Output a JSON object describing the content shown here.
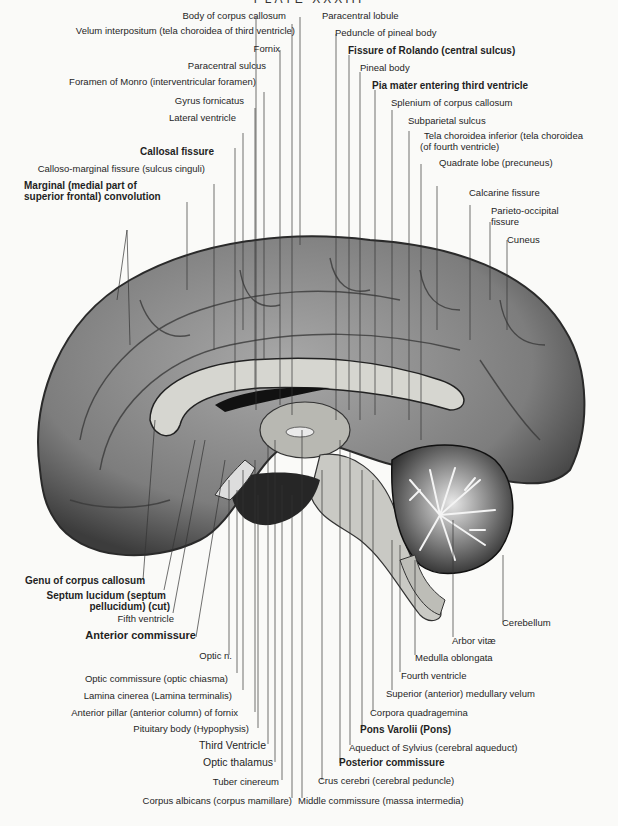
{
  "plate": {
    "title": "PLATE XXXIII"
  },
  "figure": {
    "colors": {
      "ink": "#1f1f1f",
      "cortex": "#8a8a8a",
      "cortex_dark": "#4a4a4a",
      "section": "#c9c9c4",
      "paper": "#fafaf8"
    }
  },
  "labels": {
    "top_left": [
      "Body of corpus callosum",
      "Velum interpositum (tela choroidea of third ventricle)",
      "Fornix",
      "Paracentral sulcus",
      "Foramen of Monro (interventricular foramen)",
      "Gyrus fornicatus",
      "Lateral ventricle",
      "Callosal fissure",
      "Calloso-marginal fissure (sulcus cinguli)",
      "Marginal (medial part of",
      "superior frontal) convolution"
    ],
    "top_right": [
      "Paracentral lobule",
      "Peduncle of pineal body",
      "Fissure of Rolando (central sulcus)",
      "Pineal body",
      "Pia mater entering third ventricle",
      "Splenium of corpus callosum",
      "Subparietal sulcus",
      "Tela choroidea inferior (tela choroidea",
      "(of fourth ventricle)",
      "Quadrate lobe (precuneus)",
      "Calcarine fissure",
      "Parieto-occipital",
      "fissure",
      "Cuneus"
    ],
    "bottom_left": [
      "Genu of corpus callosum",
      "Septum lucidum (septum",
      "pellucidum) (cut)",
      "Fifth ventricle",
      "Anterior commissure",
      "Optic n.",
      "Optic commissure (optic chiasma)",
      "Lamina cinerea (Lamina terminalis)",
      "Anterior pillar (anterior column) of fornix",
      "Pituitary body (Hypophysis)",
      "Third Ventricle",
      "Optic thalamus",
      "Tuber cinereum",
      "Corpus albicans (corpus mamillare)"
    ],
    "bottom_right": [
      "Cerebellum",
      "Arbor vitæ",
      "Medulla oblongata",
      "Fourth ventricle",
      "Superior (anterior) medullary velum",
      "Corpora quadragemina",
      "Pons Varolii (Pons)",
      "Aqueduct of Sylvius (cerebral aqueduct)",
      "Posterior commissure",
      "Crus cerebri (cerebral peduncle)",
      "Middle commissure (massa intermedia)"
    ]
  }
}
